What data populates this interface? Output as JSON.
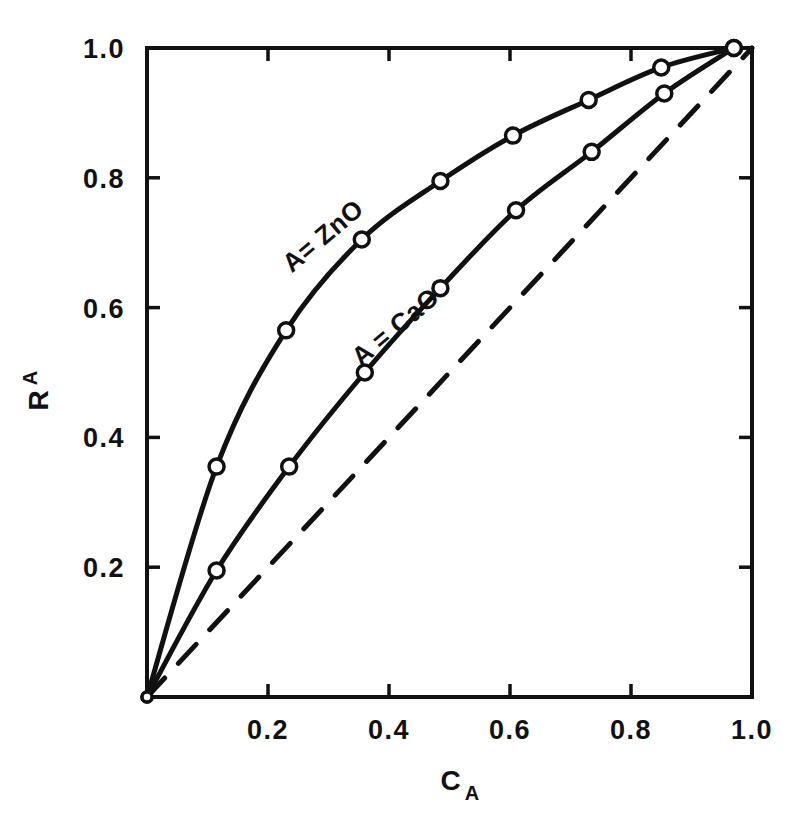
{
  "chart_data": {
    "type": "scatter",
    "title": "",
    "xlabel": "C A",
    "xlabel_main": "C",
    "xlabel_sub": "A",
    "ylabel": "R A",
    "ylabel_main": "R",
    "ylabel_sub": "A",
    "xlim": [
      0.0,
      1.0
    ],
    "ylim": [
      0.0,
      1.0
    ],
    "grid": false,
    "legend_position": "inline-curve-labels",
    "xticks": [
      0.0,
      0.2,
      0.4,
      0.6,
      0.8,
      1.0
    ],
    "yticks": [
      0.0,
      0.2,
      0.4,
      0.6,
      0.8,
      1.0
    ],
    "xtick_labels": [
      "",
      "0.2",
      "0.4",
      "0.6",
      "0.8",
      "1.0"
    ],
    "ytick_labels": [
      "",
      "0.2",
      "0.4",
      "0.6",
      "0.8",
      "1.0"
    ],
    "series": [
      {
        "name": "A = ZnO",
        "label": "A= ZnO",
        "marker": "open-circle",
        "linestyle": "solid",
        "x": [
          0.0,
          0.115,
          0.23,
          0.355,
          0.485,
          0.605,
          0.73,
          0.85,
          0.97
        ],
        "y": [
          0.0,
          0.355,
          0.565,
          0.705,
          0.795,
          0.865,
          0.92,
          0.97,
          1.0
        ]
      },
      {
        "name": "A = CaO",
        "label": "A = CaO",
        "marker": "open-circle",
        "linestyle": "solid",
        "x": [
          0.0,
          0.115,
          0.235,
          0.36,
          0.485,
          0.61,
          0.735,
          0.855,
          0.97
        ],
        "y": [
          0.0,
          0.195,
          0.355,
          0.5,
          0.63,
          0.75,
          0.84,
          0.93,
          1.0
        ]
      },
      {
        "name": "reference diagonal",
        "label": "",
        "marker": "none",
        "linestyle": "dashed",
        "x": [
          0.0,
          1.0
        ],
        "y": [
          0.0,
          1.0
        ]
      }
    ],
    "annotations": [
      {
        "text": "A= ZnO",
        "x": 0.3,
        "y": 0.7,
        "rotation": -40
      },
      {
        "text": "A = CaO",
        "x": 0.42,
        "y": 0.56,
        "rotation": -40
      }
    ]
  },
  "axes": {
    "x_tick_text": [
      "0.2",
      "0.4",
      "0.6",
      "0.8",
      "1.0"
    ],
    "y_tick_text": [
      "0.2",
      "0.4",
      "0.6",
      "0.8",
      "1.0"
    ],
    "y_top_label": "1.0"
  },
  "colors": {
    "ink": "#111111",
    "background": "#ffffff"
  }
}
